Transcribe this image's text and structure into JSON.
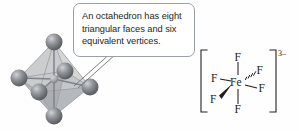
{
  "figure": {
    "background_color": "#fefefe",
    "ink_color": "#231f20"
  },
  "callout": {
    "text": "An octahedron has eight triangular faces and six equivalent vertices.",
    "border_color": "#9aa0a6",
    "fill_color": "#ffffff",
    "tail_color": "#6f7276"
  },
  "octahedron": {
    "name": "octahedron-ball-and-stick-model",
    "vertex_count": 6,
    "face_count": 8,
    "sphere_color": "#8a8d91",
    "sphere_shadow_color": "#5d6064",
    "sphere_highlight_color": "#c9ccd0",
    "face_color": "#b9bcbf",
    "edge_color": "#9a9da1",
    "bond_color": "#7f8287",
    "center_color": "#a9acb0",
    "vertices": [
      {
        "id": "top",
        "label": "",
        "cx": 46,
        "cy": 12,
        "r": 8.5
      },
      {
        "id": "bottom",
        "label": "",
        "cx": 46,
        "cy": 86,
        "r": 8.5
      },
      {
        "id": "left-back",
        "label": "",
        "cx": 11,
        "cy": 48,
        "r": 8.5
      },
      {
        "id": "left-front",
        "label": "",
        "cx": 31,
        "cy": 62,
        "r": 8.5
      },
      {
        "id": "right-back",
        "label": "",
        "cx": 57,
        "cy": 41,
        "r": 8.5
      },
      {
        "id": "right-front",
        "label": "",
        "cx": 82,
        "cy": 57,
        "r": 8.5
      }
    ]
  },
  "complex_ion": {
    "formula_name": "hexafluoridoferrate(III)-ion",
    "center_atom": "Fe",
    "charge": "3–",
    "bracket_color": "#231f20",
    "ligands": [
      {
        "id": "f-top",
        "label": "F",
        "bond": "plain",
        "x": 40,
        "y": 14
      },
      {
        "id": "f-bottom",
        "label": "F",
        "bond": "plain",
        "x": 40,
        "y": 70
      },
      {
        "id": "f-left",
        "label": "F",
        "bond": "plain",
        "x": 15,
        "y": 39
      },
      {
        "id": "f-right",
        "label": "F",
        "bond": "plain",
        "x": 66,
        "y": 48
      },
      {
        "id": "f-upper-right",
        "label": "F",
        "bond": "hashed-wedge",
        "x": 64,
        "y": 30
      },
      {
        "id": "f-lower-left",
        "label": "F",
        "bond": "solid-wedge",
        "x": 13,
        "y": 60
      }
    ]
  }
}
